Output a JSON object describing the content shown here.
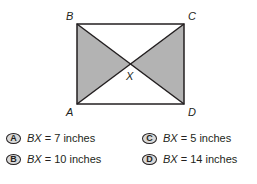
{
  "figure": {
    "vertices": {
      "B": {
        "label": "B"
      },
      "C": {
        "label": "C"
      },
      "A": {
        "label": "A"
      },
      "D": {
        "label": "D"
      },
      "X": {
        "label": "X"
      }
    },
    "shade_color": "#b3b3b3",
    "line_color": "#231f20"
  },
  "choices": [
    {
      "letter": "A",
      "var": "BX",
      "text": " = 7 inches"
    },
    {
      "letter": "B",
      "var": "BX",
      "text": " = 10 inches"
    },
    {
      "letter": "C",
      "var": "BX",
      "text": " = 5 inches"
    },
    {
      "letter": "D",
      "var": "BX",
      "text": " = 14 inches"
    }
  ]
}
